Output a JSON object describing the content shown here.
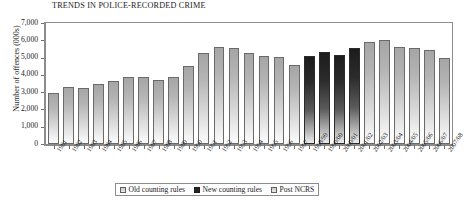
{
  "chart_data": {
    "type": "bar",
    "title": "TRENDS IN POLICE-RECORDED CRIME",
    "xlabel": "",
    "ylabel": "Number of offences (000s)",
    "ylim": [
      0,
      7000
    ],
    "yticks": [
      "0",
      "1,000",
      "2,000",
      "3,000",
      "4,000",
      "5,000",
      "6,000",
      "7,000"
    ],
    "ytick_values": [
      0,
      1000,
      2000,
      3000,
      4000,
      5000,
      6000,
      7000
    ],
    "grid": false,
    "legend_position": "bottom",
    "legend": [
      {
        "label": "Old counting rules",
        "key": "old",
        "color": "#c9c9c9"
      },
      {
        "label": "New counting rules",
        "key": "new",
        "color": "#262626"
      },
      {
        "label": "Post NCRS",
        "key": "post",
        "color": "#c9c9c9"
      }
    ],
    "categories": [
      "1981",
      "1982",
      "1983",
      "1984",
      "1985",
      "1986",
      "1987",
      "1988",
      "1989",
      "1990",
      "1991",
      "1992",
      "1993",
      "1994",
      "1995",
      "1996",
      "1997",
      "1998/99",
      "1999/00",
      "2000/01",
      "2001/02",
      "2002/03",
      "2003/04",
      "2004/05",
      "2005/06",
      "2006/07",
      "2007/08"
    ],
    "values": [
      2960,
      3290,
      3230,
      3500,
      3620,
      3850,
      3890,
      3720,
      3870,
      4540,
      5280,
      5590,
      5530,
      5250,
      5100,
      5040,
      4600,
      5110,
      5300,
      5170,
      5530,
      5900,
      6010,
      5640,
      5560,
      5430,
      4950
    ],
    "groups": [
      "old",
      "old",
      "old",
      "old",
      "old",
      "old",
      "old",
      "old",
      "old",
      "old",
      "old",
      "old",
      "old",
      "old",
      "old",
      "old",
      "old",
      "new",
      "new",
      "new",
      "new",
      "post",
      "post",
      "post",
      "post",
      "post",
      "post"
    ]
  }
}
